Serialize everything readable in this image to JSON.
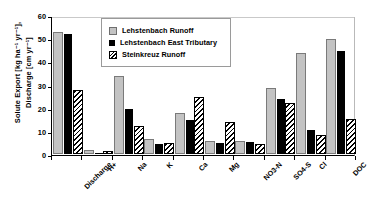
{
  "chart_data": {
    "type": "bar",
    "title": "",
    "xlabel": "",
    "ylabel": "Solute Export [kg ha-1 yr-1], Discharge [cm yr-1]",
    "ylabel_line1": "Solute Export [kg ha⁻¹ yr⁻¹],",
    "ylabel_line2": "Discharge [cm yr⁻¹]",
    "ylim": [
      0,
      60
    ],
    "yticks": [
      0,
      10,
      20,
      30,
      40,
      50,
      60
    ],
    "grid": false,
    "legend_position": "top-center",
    "categories": [
      "Discharge",
      "H+",
      "Na",
      "K",
      "Ca",
      "Mg",
      "NO3-N",
      "SO4-S",
      "Cl",
      "DOC"
    ],
    "series": [
      {
        "name": "Lehstenbach Runoff",
        "style": "light-gray-fill",
        "color": "#c3c3c3",
        "values": [
          52,
          0.7,
          33,
          5.5,
          17,
          5,
          5,
          28,
          43,
          49
        ]
      },
      {
        "name": "Lehstenbach East Tributary",
        "style": "solid-black-fill",
        "color": "#000000",
        "values": [
          52,
          0.5,
          19.5,
          4.5,
          15,
          5,
          5.2,
          24,
          10.5,
          45
        ]
      },
      {
        "name": "Steinkreuz Runoff",
        "style": "diagonal-hatch",
        "color": "#ffffff",
        "values": [
          27,
          0.2,
          11.5,
          4,
          24,
          13,
          3.6,
          21.5,
          7.5,
          14.5
        ]
      }
    ]
  }
}
